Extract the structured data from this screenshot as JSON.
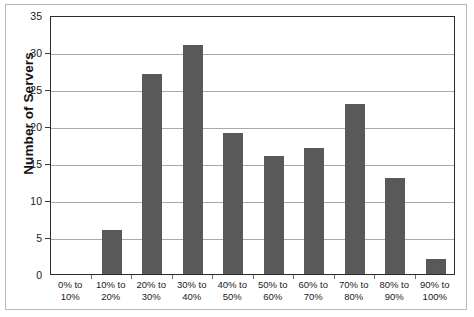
{
  "chart_data": {
    "type": "bar",
    "title": "",
    "xlabel": "",
    "ylabel": "Number of Servers",
    "ylim": [
      0,
      35
    ],
    "ytick_step": 5,
    "yticks": [
      0,
      5,
      10,
      15,
      20,
      25,
      30,
      35
    ],
    "grid": true,
    "legend": "none",
    "categories": [
      "0% to 10%",
      "10% to 20%",
      "20% to 30%",
      "30% to 40%",
      "40% to 50%",
      "50% to 60%",
      "60% to 70%",
      "70% to 80%",
      "80% to 90%",
      "90% to 100%"
    ],
    "category_lines": [
      [
        "0% to",
        "10%"
      ],
      [
        "10% to",
        "20%"
      ],
      [
        "20% to",
        "30%"
      ],
      [
        "30% to",
        "40%"
      ],
      [
        "40% to",
        "50%"
      ],
      [
        "50% to",
        "60%"
      ],
      [
        "60% to",
        "70%"
      ],
      [
        "70% to",
        "80%"
      ],
      [
        "80% to",
        "90%"
      ],
      [
        "90% to",
        "100%"
      ]
    ],
    "values": [
      0,
      6,
      27,
      31,
      19,
      16,
      17,
      23,
      13,
      2
    ]
  },
  "style": {
    "bar_color": "#595959",
    "gridline_color": "#a9a9a9",
    "axis_color": "#2b2b2b",
    "text_color": "#1a1a1a",
    "frame_color": "#b9b9b9",
    "background": "#ffffff"
  }
}
